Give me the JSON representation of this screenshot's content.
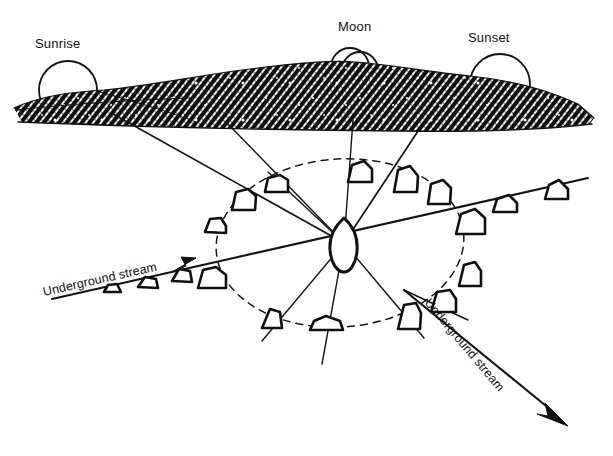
{
  "diagram": {
    "background_color": "#ffffff",
    "ink_color": "#111111",
    "labels": {
      "sunrise": "Sunrise",
      "moon": "Moon",
      "sunset": "Sunset",
      "stream_left": "Underground stream",
      "stream_right": "Underground stream"
    },
    "celestial_bodies": [
      {
        "name": "sunrise-sun",
        "label": "Sunrise",
        "shape": "semicircle",
        "cx": 68,
        "cy": 88,
        "r": 29
      },
      {
        "name": "moon",
        "label": "Moon",
        "shape": "double-circle",
        "cx": 354,
        "cy": 66,
        "r": 20
      },
      {
        "name": "sunset-sun",
        "label": "Sunset",
        "shape": "semicircle",
        "cx": 500,
        "cy": 82,
        "r": 30
      }
    ],
    "horizon": {
      "name": "hatched-hill",
      "fill": "hatch",
      "color": "#1a1a1a",
      "top_y": 62,
      "bottom_y": 127
    },
    "center_stone": {
      "cx": 344,
      "cy": 243,
      "rx": 14,
      "ry": 22
    },
    "ring": {
      "cx": 338,
      "cy": 243,
      "rx": 122,
      "ry": 83,
      "style": "dashed"
    },
    "stone_count": 17,
    "stones": [
      {
        "x": 272,
        "y": 175,
        "w": 24,
        "h": 21
      },
      {
        "x": 242,
        "y": 189,
        "w": 23,
        "h": 22
      },
      {
        "x": 212,
        "y": 218,
        "w": 19,
        "h": 16
      },
      {
        "x": 209,
        "y": 267,
        "w": 24,
        "h": 20
      },
      {
        "x": 270,
        "y": 309,
        "w": 17,
        "h": 20
      },
      {
        "x": 321,
        "y": 317,
        "w": 25,
        "h": 14
      },
      {
        "x": 404,
        "y": 303,
        "w": 20,
        "h": 25
      },
      {
        "x": 439,
        "y": 290,
        "w": 21,
        "h": 22
      },
      {
        "x": 466,
        "y": 261,
        "w": 19,
        "h": 23
      },
      {
        "x": 464,
        "y": 209,
        "w": 25,
        "h": 24
      },
      {
        "x": 434,
        "y": 180,
        "w": 20,
        "h": 23
      },
      {
        "x": 400,
        "y": 166,
        "w": 21,
        "h": 25
      },
      {
        "x": 355,
        "y": 161,
        "w": 20,
        "h": 20
      },
      {
        "x": 497,
        "y": 195,
        "w": 21,
        "h": 16
      },
      {
        "x": 549,
        "y": 180,
        "w": 21,
        "h": 18
      }
    ],
    "rays": [
      {
        "from": "hill-sunrise",
        "x1": 113,
        "y1": 114,
        "x2": 344,
        "y2": 243
      },
      {
        "from": "hill-mid",
        "x1": 228,
        "y1": 124,
        "x2": 344,
        "y2": 243
      },
      {
        "from": "hill-moon",
        "x1": 354,
        "y1": 120,
        "x2": 344,
        "y2": 243
      },
      {
        "from": "hill-sunset",
        "x1": 427,
        "y1": 116,
        "x2": 344,
        "y2": 243
      },
      {
        "to": "lower-left",
        "x1": 344,
        "y1": 243,
        "x2": 262,
        "y2": 339
      },
      {
        "to": "bottom",
        "x1": 344,
        "y1": 243,
        "x2": 322,
        "y2": 362
      },
      {
        "to": "lower-right",
        "x1": 344,
        "y1": 243,
        "x2": 420,
        "y2": 335
      }
    ],
    "streams": [
      {
        "name": "stream-left",
        "label": "Underground stream",
        "x1": 52,
        "y1": 297,
        "x2": 585,
        "y2": 179,
        "arrow_at": {
          "x": 183,
          "y": 266
        }
      },
      {
        "name": "stream-right",
        "label": "Underground stream",
        "x1": 404,
        "y1": 292,
        "x2": 565,
        "y2": 423,
        "arrow_at": {
          "x": 565,
          "y": 423
        }
      }
    ]
  }
}
